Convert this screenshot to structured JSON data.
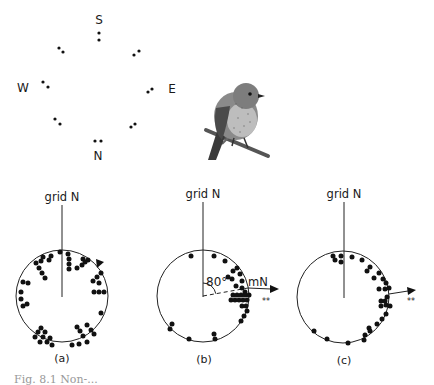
{
  "figure": {
    "compass": {
      "labels": {
        "north": "N",
        "south": "S",
        "east": "E",
        "west": "W"
      },
      "center": [
        99,
        76
      ],
      "dot_pairs": [
        [
          [
            99,
            33
          ],
          [
            99,
            40
          ]
        ],
        [
          [
            59,
            48
          ],
          [
            63,
            52
          ]
        ],
        [
          [
            134,
            55
          ],
          [
            139,
            51
          ]
        ],
        [
          [
            43,
            82
          ],
          [
            48,
            87
          ]
        ],
        [
          [
            148,
            92
          ],
          [
            152,
            89
          ]
        ],
        [
          [
            55,
            119
          ],
          [
            60,
            124
          ]
        ],
        [
          [
            131,
            127
          ],
          [
            135,
            124
          ]
        ],
        [
          [
            95,
            141
          ],
          [
            101,
            141
          ]
        ]
      ]
    },
    "illustration": {
      "subject": "robin-on-branch"
    },
    "panels": [
      {
        "id": "a",
        "label": "(a)",
        "grid_label": "grid N",
        "center": [
          62,
          296
        ],
        "radius": 46,
        "has_arrow": true,
        "arrow_type": "tick-on-rim",
        "dots": [
          [
            60,
            252
          ],
          [
            68,
            254
          ],
          [
            69,
            259
          ],
          [
            69,
            264
          ],
          [
            69,
            269
          ],
          [
            51,
            256
          ],
          [
            49,
            260
          ],
          [
            41,
            261
          ],
          [
            43,
            257
          ],
          [
            36,
            263
          ],
          [
            39,
            268
          ],
          [
            42,
            273
          ],
          [
            45,
            278
          ],
          [
            88,
            260
          ],
          [
            83,
            259
          ],
          [
            82,
            265
          ],
          [
            85,
            262
          ],
          [
            77,
            268
          ],
          [
            101,
            273
          ],
          [
            97,
            277
          ],
          [
            93,
            281
          ],
          [
            99,
            283
          ],
          [
            94,
            292
          ],
          [
            99,
            292
          ],
          [
            104,
            292
          ],
          [
            101,
            313
          ],
          [
            23,
            282
          ],
          [
            28,
            283
          ],
          [
            21,
            292
          ],
          [
            21,
            299
          ],
          [
            23,
            306
          ],
          [
            27,
            304
          ],
          [
            41,
            328
          ],
          [
            38,
            332
          ],
          [
            35,
            337
          ],
          [
            45,
            332
          ],
          [
            43,
            337
          ],
          [
            40,
            342
          ],
          [
            50,
            338
          ],
          [
            47,
            342
          ],
          [
            52,
            345
          ],
          [
            77,
            327
          ],
          [
            80,
            331
          ],
          [
            83,
            336
          ],
          [
            87,
            342
          ],
          [
            87,
            325
          ],
          [
            91,
            330
          ],
          [
            94,
            334
          ],
          [
            72,
            345
          ],
          [
            79,
            344
          ]
        ]
      },
      {
        "id": "b",
        "label": "(b)",
        "grid_label": "grid N",
        "magnetic_label": "mN",
        "angle_label": "80°",
        "significance": "**",
        "center": [
          203,
          296
        ],
        "radius": 46,
        "dots": [
          [
            191,
            256
          ],
          [
            214,
            256
          ],
          [
            225,
            261
          ],
          [
            233,
            271
          ],
          [
            237,
            268
          ],
          [
            228,
            277
          ],
          [
            232,
            279
          ],
          [
            240,
            274
          ],
          [
            242,
            281
          ],
          [
            236,
            286
          ],
          [
            242,
            288
          ],
          [
            245,
            292
          ],
          [
            233,
            295
          ],
          [
            237,
            295
          ],
          [
            241,
            295
          ],
          [
            245,
            295
          ],
          [
            249,
            295
          ],
          [
            231,
            300
          ],
          [
            235,
            300
          ],
          [
            239,
            300
          ],
          [
            243,
            300
          ],
          [
            247,
            300
          ],
          [
            242,
            306
          ],
          [
            246,
            306
          ],
          [
            247,
            311
          ],
          [
            244,
            316
          ],
          [
            241,
            321
          ],
          [
            172,
            324
          ],
          [
            170,
            329
          ],
          [
            189,
            339
          ],
          [
            214,
            334
          ],
          [
            215,
            339
          ]
        ]
      },
      {
        "id": "c",
        "label": "(c)",
        "grid_label": "grid N",
        "significance": "**",
        "center": [
          343,
          297
        ],
        "radius": 46,
        "dots": [
          [
            333,
            256
          ],
          [
            341,
            256
          ],
          [
            335,
            260
          ],
          [
            341,
            262
          ],
          [
            352,
            257
          ],
          [
            362,
            260
          ],
          [
            370,
            267
          ],
          [
            367,
            271
          ],
          [
            379,
            273
          ],
          [
            374,
            278
          ],
          [
            383,
            279
          ],
          [
            386,
            283
          ],
          [
            379,
            289
          ],
          [
            385,
            289
          ],
          [
            389,
            288
          ],
          [
            387,
            297
          ],
          [
            381,
            301
          ],
          [
            385,
            301
          ],
          [
            381,
            306
          ],
          [
            386,
            305
          ],
          [
            390,
            306
          ],
          [
            386,
            314
          ],
          [
            382,
            319
          ],
          [
            377,
            324
          ],
          [
            369,
            328
          ],
          [
            365,
            335
          ],
          [
            370,
            331
          ],
          [
            314,
            331
          ],
          [
            327,
            339
          ],
          [
            348,
            343
          ],
          [
            364,
            340
          ]
        ]
      }
    ],
    "caption": "Fig. 8.1  Non-..."
  }
}
